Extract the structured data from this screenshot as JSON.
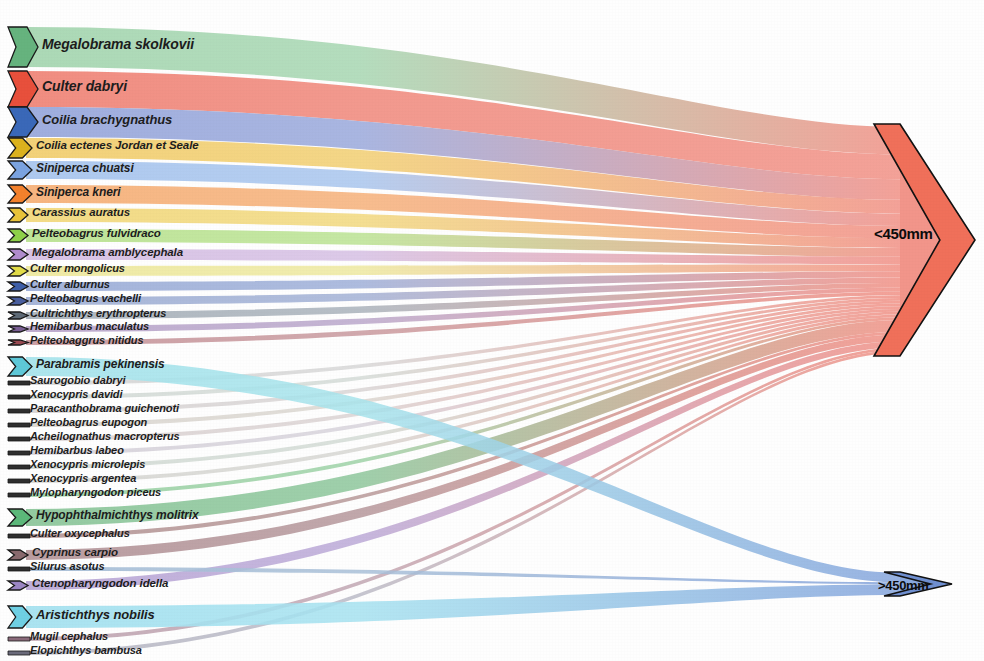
{
  "chart_data": {
    "type": "sankey",
    "title": "",
    "xlabel": "",
    "ylabel": "",
    "legend_position": "none",
    "grid": false,
    "targets": [
      {
        "id": "lt450",
        "label": "<450mm",
        "color": "#f0705a",
        "fill": "#f2958a",
        "value": 93.4
      },
      {
        "id": "gt450",
        "label": ">450mm",
        "color": "#6f8fd0",
        "fill": "#8aa8de",
        "value": 6.6
      }
    ],
    "sources": [
      {
        "name": "Megalobrama skolkovii",
        "color": "#66b37e",
        "band": "#a7d7b2",
        "value": 17.2,
        "target": "lt450"
      },
      {
        "name": "Culter dabryi",
        "color": "#e8503c",
        "band": "#f0877a",
        "value": 15.0,
        "target": "lt450"
      },
      {
        "name": "Coilia brachygnathus",
        "color": "#3a68b8",
        "band": "#9aa9dc",
        "value": 12.5,
        "target": "lt450"
      },
      {
        "name": "Coilia ectenes Jordan et Seale",
        "color": "#dcb21e",
        "band": "#f2cf72",
        "value": 7.4,
        "target": "lt450"
      },
      {
        "name": "Siniperca chuatsi",
        "color": "#7ba3e0",
        "band": "#a9c6ee",
        "value": 6.4,
        "target": "lt450"
      },
      {
        "name": "Siniperca kneri",
        "color": "#f4812c",
        "band": "#f6b17a",
        "value": 6.2,
        "target": "lt450"
      },
      {
        "name": "Carassius auratus",
        "color": "#e8c33a",
        "band": "#f2d97f",
        "value": 4.6,
        "target": "lt450"
      },
      {
        "name": "Pelteobagrus fulvidraco",
        "color": "#8ed14a",
        "band": "#bbe393",
        "value": 4.1,
        "target": "lt450"
      },
      {
        "name": "Megalobrama amblycephala",
        "color": "#b08cce",
        "band": "#d6c0e4",
        "value": 2.9,
        "target": "lt450"
      },
      {
        "name": "Culter mongolicus",
        "color": "#e2dc48",
        "band": "#eee9a0",
        "value": 2.5,
        "target": "lt450"
      },
      {
        "name": "Culter alburnus",
        "color": "#3f5fa8",
        "band": "#9fb0d9",
        "value": 2.1,
        "target": "lt450"
      },
      {
        "name": "Pelteobagrus vachelli",
        "color": "#4a5f9e",
        "band": "#a3b2d6",
        "value": 1.8,
        "target": "lt450"
      },
      {
        "name": "Cultrichthys erythropterus",
        "color": "#5e6a76",
        "band": "#aab3bc",
        "value": 1.5,
        "target": "lt450"
      },
      {
        "name": "Hemibarbus maculatus",
        "color": "#7a5f94",
        "band": "#bba8cc",
        "value": 1.3,
        "target": "lt450"
      },
      {
        "name": "Pelteobaggrus nitidus",
        "color": "#9a4a52",
        "band": "#c99a9f",
        "value": 1.1,
        "target": "lt450"
      },
      {
        "name": "Parabramis pekinensis",
        "color": "#5ec8d8",
        "band": "#a8e4ec",
        "value": 4.0,
        "target": "gt450"
      },
      {
        "name": "Saurogobio dabryi",
        "color": "#2f2f2f",
        "band": "#d8d8d8",
        "value": 0.7,
        "target": "lt450"
      },
      {
        "name": "Xenocypris davidi",
        "color": "#2f2f2f",
        "band": "#d5dcd8",
        "value": 0.6,
        "target": "lt450"
      },
      {
        "name": "Paracanthobrama guichenoti",
        "color": "#2f2f2f",
        "band": "#dad6d6",
        "value": 0.6,
        "target": "lt450"
      },
      {
        "name": "Pelteobagrus eupogon",
        "color": "#2f2f2f",
        "band": "#dcd8d2",
        "value": 0.5,
        "target": "lt450"
      },
      {
        "name": "Acheilognathus macropterus",
        "color": "#2f2f2f",
        "band": "#dcd4d4",
        "value": 0.5,
        "target": "lt450"
      },
      {
        "name": "Hemibarbus labeo",
        "color": "#2f2f2f",
        "band": "#d8d4dc",
        "value": 0.4,
        "target": "lt450"
      },
      {
        "name": "Xenocypris microlepis",
        "color": "#2f2f2f",
        "band": "#d4dcd6",
        "value": 0.4,
        "target": "lt450"
      },
      {
        "name": "Xenocypris argentea",
        "color": "#2f2f2f",
        "band": "#d8d8d4",
        "value": 0.3,
        "target": "lt450"
      },
      {
        "name": "Mylopharyngodon piceus",
        "color": "#2f2f2f",
        "band": "#9fd3a8",
        "value": 1.4,
        "target": "lt450"
      },
      {
        "name": "Hypophthalmichthys molitrix",
        "color": "#5cb87a",
        "band": "#8ec79c",
        "value": 2.2,
        "target": "lt450"
      },
      {
        "name": "Culter oxycephalus",
        "color": "#2f2f2f",
        "band": "#b89a9a",
        "value": 1.0,
        "target": "lt450"
      },
      {
        "name": "Cyprinus carpio",
        "color": "#8a6a6e",
        "band": "#b6989c",
        "value": 1.6,
        "target": "lt450"
      },
      {
        "name": "Silurus asotus",
        "color": "#2f2f2f",
        "band": "#a9c0d8",
        "value": 0.8,
        "target": "gt450"
      },
      {
        "name": "Ctenopharyngodon idella",
        "color": "#9b86c4",
        "band": "#bcaad8",
        "value": 1.2,
        "target": "lt450"
      },
      {
        "name": "Aristichthys nobilis",
        "color": "#6fd0e4",
        "band": "#a6e2f0",
        "value": 3.5,
        "target": "gt450"
      },
      {
        "name": "Mugil cephalus",
        "color": "#8a6a7a",
        "band": "#c2a8b4",
        "value": 0.2,
        "target": "lt450"
      },
      {
        "name": "Elopichthys bambusa",
        "color": "#6a6a7a",
        "band": "#bcbcc8",
        "value": 0.2,
        "target": "lt450"
      }
    ],
    "nodes": [
      {
        "name": "Megalobrama skolkovii",
        "y": 27,
        "h": 40,
        "shape": "chevron-large",
        "color": "#66b37e",
        "label_x": 42,
        "label_size": 14
      },
      {
        "name": "Culter dabryi",
        "y": 71,
        "h": 36,
        "shape": "chevron-large",
        "color": "#e8503c",
        "label_x": 42,
        "label_size": 14
      },
      {
        "name": "Coilia brachygnathus",
        "y": 107,
        "h": 30,
        "shape": "chevron-large",
        "color": "#3a68b8",
        "label_x": 42,
        "label_size": 13
      },
      {
        "name": "Coilia ectenes Jordan et Seale",
        "y": 138,
        "h": 20,
        "shape": "chevron-mid",
        "color": "#dcb21e",
        "label_x": 36,
        "label_size": 11.5
      },
      {
        "name": "Siniperca chuatsi",
        "y": 161,
        "h": 18,
        "shape": "chevron-mid",
        "color": "#7ba3e0",
        "label_x": 36,
        "label_size": 12
      },
      {
        "name": "Siniperca kneri",
        "y": 185,
        "h": 18,
        "shape": "chevron-mid",
        "color": "#f4812c",
        "label_x": 36,
        "label_size": 12
      },
      {
        "name": "Carassius auratus",
        "y": 208,
        "h": 14,
        "shape": "chevron-small",
        "color": "#e8c33a",
        "label_x": 32,
        "label_size": 11.5
      },
      {
        "name": "Pelteobagrus fulvidraco",
        "y": 229,
        "h": 13,
        "shape": "chevron-small",
        "color": "#8ed14a",
        "label_x": 32,
        "label_size": 11.5
      },
      {
        "name": "Megalobrama amblycephala",
        "y": 249,
        "h": 11,
        "shape": "chevron-small",
        "color": "#b08cce",
        "label_x": 32,
        "label_size": 11.5
      },
      {
        "name": "Culter mongolicus",
        "y": 266,
        "h": 10,
        "shape": "chevron-small",
        "color": "#e2dc48",
        "label_x": 30,
        "label_size": 11
      },
      {
        "name": "Culter alburnus",
        "y": 282,
        "h": 9,
        "shape": "chevron-small",
        "color": "#3f5fa8",
        "label_x": 30,
        "label_size": 11
      },
      {
        "name": "Pelteobagrus vachelli",
        "y": 297,
        "h": 8,
        "shape": "chevron-small",
        "color": "#4a5f9e",
        "label_x": 30,
        "label_size": 11
      },
      {
        "name": "Cultrichthys erythropterus",
        "y": 312,
        "h": 7,
        "shape": "chevron-small",
        "color": "#5e6a76",
        "label_x": 30,
        "label_size": 11
      },
      {
        "name": "Hemibarbus maculatus",
        "y": 326,
        "h": 6,
        "shape": "chevron-small",
        "color": "#7a5f94",
        "label_x": 30,
        "label_size": 11
      },
      {
        "name": "Pelteobaggrus nitidus",
        "y": 340,
        "h": 5,
        "shape": "chevron-small",
        "color": "#9a4a52",
        "label_x": 30,
        "label_size": 11
      },
      {
        "name": "Parabramis pekinensis",
        "y": 357,
        "h": 19,
        "shape": "chevron-mid",
        "color": "#5ec8d8",
        "label_x": 36,
        "label_size": 12
      },
      {
        "name": "Saurogobio dabryi",
        "y": 381,
        "h": 4,
        "shape": "bar",
        "color": "#2f2f2f",
        "label_x": 30,
        "label_size": 11
      },
      {
        "name": "Xenocypris davidi",
        "y": 395,
        "h": 4,
        "shape": "bar",
        "color": "#2f2f2f",
        "label_x": 30,
        "label_size": 11
      },
      {
        "name": "Paracanthobrama guichenoti",
        "y": 409,
        "h": 4,
        "shape": "bar",
        "color": "#2f2f2f",
        "label_x": 30,
        "label_size": 11
      },
      {
        "name": "Pelteobagrus eupogon",
        "y": 423,
        "h": 4,
        "shape": "bar",
        "color": "#2f2f2f",
        "label_x": 30,
        "label_size": 11
      },
      {
        "name": "Acheilognathus macropterus",
        "y": 437,
        "h": 4,
        "shape": "bar",
        "color": "#2f2f2f",
        "label_x": 30,
        "label_size": 11
      },
      {
        "name": "Hemibarbus labeo",
        "y": 451,
        "h": 4,
        "shape": "bar",
        "color": "#2f2f2f",
        "label_x": 30,
        "label_size": 11
      },
      {
        "name": "Xenocypris microlepis",
        "y": 465,
        "h": 4,
        "shape": "bar",
        "color": "#2f2f2f",
        "label_x": 30,
        "label_size": 11
      },
      {
        "name": "Xenocypris argentea",
        "y": 479,
        "h": 4,
        "shape": "bar",
        "color": "#2f2f2f",
        "label_x": 30,
        "label_size": 11
      },
      {
        "name": "Mylopharyngodon piceus",
        "y": 493,
        "h": 4,
        "shape": "bar",
        "color": "#2f2f2f",
        "label_x": 30,
        "label_size": 11
      },
      {
        "name": "Hypophthalmichthys molitrix",
        "y": 509,
        "h": 17,
        "shape": "chevron-mid",
        "color": "#5cb87a",
        "label_x": 36,
        "label_size": 12
      },
      {
        "name": "Culter oxycephalus",
        "y": 534,
        "h": 4,
        "shape": "bar",
        "color": "#2f2f2f",
        "label_x": 30,
        "label_size": 11
      },
      {
        "name": "Cyprinus carpio",
        "y": 550,
        "h": 10,
        "shape": "chevron-small",
        "color": "#8a6a6e",
        "label_x": 32,
        "label_size": 11.5
      },
      {
        "name": "Silurus asotus",
        "y": 567,
        "h": 4,
        "shape": "bar",
        "color": "#2f2f2f",
        "label_x": 30,
        "label_size": 11
      },
      {
        "name": "Ctenopharyngodon idella",
        "y": 581,
        "h": 9,
        "shape": "chevron-small",
        "color": "#9b86c4",
        "label_x": 32,
        "label_size": 11.5
      },
      {
        "name": "Aristichthys nobilis",
        "y": 606,
        "h": 22,
        "shape": "chevron-mid",
        "color": "#6fd0e4",
        "label_x": 36,
        "label_size": 13
      },
      {
        "name": "Mugil cephalus",
        "y": 637,
        "h": 4,
        "shape": "bar",
        "color": "#8a6a7a",
        "label_x": 30,
        "label_size": 11
      },
      {
        "name": "Elopichthys bambusa",
        "y": 651,
        "h": 4,
        "shape": "bar",
        "color": "#6a6a7a",
        "label_x": 30,
        "label_size": 11
      }
    ]
  },
  "figure": {
    "target_lt450": "<450mm",
    "target_gt450": ">450mm"
  }
}
